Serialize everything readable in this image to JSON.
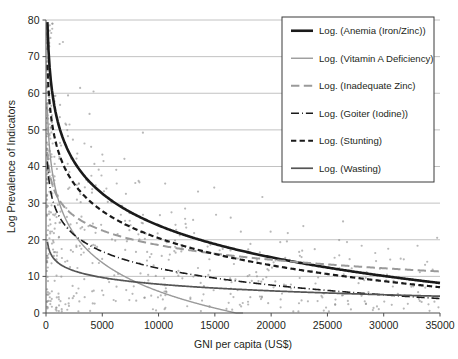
{
  "chart_data": {
    "type": "line",
    "title": "",
    "xlabel": "GNI per capita (US$)",
    "ylabel": "Log Prevalence of Indicators",
    "xlim": [
      0,
      35000
    ],
    "ylim": [
      0,
      80
    ],
    "xticks": [
      0,
      5000,
      10000,
      15000,
      20000,
      25000,
      30000,
      35000
    ],
    "xtick_labels": [
      "0",
      "5000",
      "10000",
      "15000",
      "20000",
      "25000",
      "30000",
      "35000"
    ],
    "yticks": [
      0,
      10,
      20,
      30,
      40,
      50,
      60,
      70,
      80
    ],
    "ytick_labels": [
      "0",
      "10",
      "20",
      "30",
      "40",
      "50",
      "60",
      "70",
      "80"
    ],
    "grid": "horizontal",
    "legend_position": "top-right",
    "note": "Each series is a logarithmic trendline y = a - b*ln(x); sample points are the underlying country scatter.",
    "series": [
      {
        "name": "Log. (Anemia (Iron/Zinc))",
        "style": "solid",
        "color": "#1a1a1a",
        "width": 2.6,
        "fit": {
          "a": 139.5,
          "b": 12.55
        },
        "x": [
          120,
          500,
          1000,
          2000,
          3000,
          5000,
          7500,
          10000,
          15000,
          20000,
          25000,
          30000,
          35000
        ],
        "y": [
          79.3,
          61.4,
          52.7,
          44.0,
          38.9,
          32.5,
          27.4,
          23.8,
          18.7,
          15.1,
          12.3,
          10.0,
          8.1
        ]
      },
      {
        "name": "Log. (Vitamin A Deficiency)",
        "style": "solid",
        "color": "#9a9a9a",
        "width": 1.4,
        "fit": {
          "a": 110.0,
          "b": 11.3
        },
        "x": [
          120,
          500,
          1000,
          2000,
          3000,
          5000,
          7500,
          10000,
          12500,
          15000,
          17500
        ],
        "y": [
          55.9,
          39.8,
          31.9,
          24.1,
          19.5,
          13.7,
          9.1,
          6.0,
          3.5,
          1.6,
          0.0
        ]
      },
      {
        "name": "Log. (Inadequate Zinc)",
        "style": "long-dash",
        "color": "#9a9a9a",
        "width": 2.0,
        "fit": {
          "a": 71.5,
          "b": 5.75
        },
        "x": [
          120,
          500,
          1000,
          2000,
          3000,
          5000,
          7500,
          10000,
          15000,
          20000,
          25000,
          30000,
          35000
        ],
        "y": [
          44.0,
          35.8,
          31.8,
          27.8,
          25.4,
          22.5,
          20.2,
          18.5,
          16.2,
          14.5,
          13.2,
          12.2,
          11.3
        ]
      },
      {
        "name": "Log. (Goiter (Iodine))",
        "style": "dash-dot",
        "color": "#1a1a1a",
        "width": 1.6,
        "fit": {
          "a": 73.0,
          "b": 6.6
        },
        "x": [
          120,
          500,
          1000,
          2000,
          3000,
          5000,
          7500,
          10000,
          15000,
          20000,
          25000,
          30000,
          35000
        ],
        "y": [
          41.4,
          32.0,
          27.4,
          22.8,
          20.2,
          16.8,
          14.1,
          12.2,
          9.5,
          7.6,
          6.1,
          4.9,
          3.9
        ]
      },
      {
        "name": "Log. (Stunting)",
        "style": "dash",
        "color": "#1a1a1a",
        "width": 2.2,
        "fit": {
          "a": 119.0,
          "b": 10.7
        },
        "x": [
          120,
          500,
          1000,
          2000,
          3000,
          5000,
          7500,
          10000,
          15000,
          20000,
          25000,
          30000,
          35000
        ],
        "y": [
          67.8,
          52.5,
          45.1,
          37.7,
          33.3,
          27.8,
          23.5,
          20.4,
          16.1,
          13.0,
          10.6,
          8.6,
          7.0
        ]
      },
      {
        "name": "Log. (Wasting)",
        "style": "solid",
        "color": "#555555",
        "width": 1.7,
        "fit": {
          "a": 32.0,
          "b": 2.62
        },
        "x": [
          120,
          500,
          1000,
          2000,
          3000,
          5000,
          7500,
          10000,
          15000,
          20000,
          25000,
          30000,
          35000
        ],
        "y": [
          19.5,
          15.7,
          13.9,
          12.1,
          11.0,
          9.7,
          8.6,
          7.9,
          6.8,
          6.1,
          5.5,
          5.0,
          4.6
        ]
      }
    ],
    "scatter": {
      "color": "#8c8c8c",
      "marker": "dot",
      "size": 1.1,
      "seed": 20240517,
      "count": 620,
      "description": "Country-level observations of micronutrient indicator prevalence vs GNI per capita, densest below 5000 US$."
    }
  },
  "legend": {
    "entries": [
      {
        "label": "Log. (Anemia (Iron/Zinc))"
      },
      {
        "label": "Log. (Vitamin A Deficiency)"
      },
      {
        "label": "Log. (Inadequate Zinc)"
      },
      {
        "label": "Log. (Goiter (Iodine))"
      },
      {
        "label": "Log. (Stunting)"
      },
      {
        "label": "Log. (Wasting)"
      }
    ]
  },
  "colors": {
    "gridline": "#b3b3b3",
    "axis": "#4d4d4d",
    "text": "#231f20",
    "background": "#ffffff",
    "legend_border": "#3a3a3a"
  }
}
